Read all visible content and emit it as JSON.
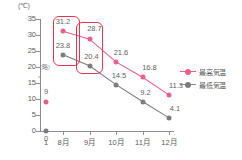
{
  "chart_data": {
    "type": "line",
    "title": "",
    "unit_label": "(℃)",
    "xlabel": "",
    "ylabel": "",
    "ylim": [
      0,
      35
    ],
    "ytick_labels": [
      "0",
      "5",
      "10",
      "15",
      "20",
      "25",
      "30",
      "35"
    ],
    "grid": false,
    "axis_break": true,
    "axis_break_note": "(略)",
    "legend_position": "right",
    "categories": [
      "1月",
      "8月",
      "9月",
      "10月",
      "11月",
      "12月"
    ],
    "xtick_labels": [
      "1",
      "8月",
      "9月",
      "10月",
      "11月",
      "12月"
    ],
    "series": [
      {
        "name": "最高気温",
        "color": "#e8608a",
        "values": [
          9.0,
          31.2,
          28.7,
          21.6,
          16.8,
          11.3
        ],
        "labels": [
          "9",
          "31.2",
          "28.7",
          "21.6",
          "16.8",
          "11.3"
        ]
      },
      {
        "name": "最低気温",
        "color": "#7d7d7d",
        "values": [
          0.0,
          23.8,
          20.4,
          14.5,
          9.2,
          4.1
        ],
        "labels": [
          "0",
          "23.8",
          "20.4",
          "14.5",
          "9.2",
          "4.1"
        ]
      }
    ],
    "annotations": [
      {
        "name": "highlight-august",
        "color": "#e8344f",
        "shape": "rounded-rect",
        "covers": [
          "31.2",
          "23.8"
        ]
      },
      {
        "name": "highlight-september",
        "color": "#e8344f",
        "shape": "rounded-rect",
        "covers": [
          "28.7",
          "20.4"
        ]
      }
    ]
  }
}
